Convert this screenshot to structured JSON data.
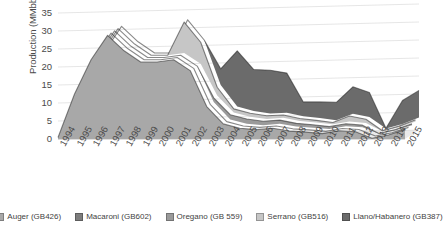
{
  "chart_data": {
    "type": "area",
    "stacked": true,
    "three_d": true,
    "title": "",
    "xlabel": "",
    "ylabel": "Production (MMbbl)",
    "ylim": [
      0,
      35
    ],
    "ytick_step": 5,
    "yticks": [
      35,
      30,
      25,
      20,
      15,
      10,
      5,
      0
    ],
    "grid": true,
    "legend_position": "bottom",
    "x": [
      "1994",
      "1995",
      "1996",
      "1997",
      "1998",
      "1999",
      "2000",
      "2001",
      "2002",
      "2003",
      "2004",
      "2005",
      "2006",
      "2007",
      "2008",
      "2009",
      "2010",
      "2011",
      "2012",
      "2013",
      "2014",
      "2015"
    ],
    "categories": [
      "1994",
      "1995",
      "1996",
      "1997",
      "1998",
      "1999",
      "2000",
      "2001",
      "2002",
      "2003",
      "2004",
      "2005",
      "2006",
      "2007",
      "2008",
      "2009",
      "2010",
      "2011",
      "2012",
      "2013",
      "2014",
      "2015"
    ],
    "series": [
      {
        "name": "Auger (GB426)",
        "color": "#a8a8a8",
        "values": [
          0.4,
          12.5,
          22.0,
          28.8,
          24.5,
          21.4,
          21.4,
          22.0,
          19.0,
          9.0,
          4.2,
          3.0,
          2.6,
          3.0,
          2.2,
          1.9,
          1.5,
          2.3,
          2.0,
          0.2,
          1.1,
          2.6
        ]
      },
      {
        "name": "Macaroni (GB602)",
        "color": "#7d7d7d",
        "values": [
          0.0,
          0.0,
          0.0,
          0.0,
          0.0,
          0.0,
          0.0,
          0.0,
          0.0,
          0.0,
          0.0,
          0.0,
          0.0,
          0.0,
          0.0,
          0.0,
          0.0,
          0.0,
          0.0,
          0.0,
          0.0,
          0.0
        ]
      },
      {
        "name": "Oregano (GB 559)",
        "color": "#9a9a9a",
        "values": [
          0.0,
          0.0,
          0.0,
          0.0,
          0.0,
          0.0,
          0.0,
          0.0,
          0.0,
          1.2,
          1.3,
          1.3,
          1.1,
          1.0,
          0.9,
          0.8,
          0.7,
          0.7,
          0.6,
          0.1,
          0.3,
          0.4
        ]
      },
      {
        "name": "Serrano (GB516)",
        "color": "#c6c6c6",
        "values": [
          0.0,
          0.0,
          0.0,
          0.0,
          0.0,
          0.0,
          0.0,
          8.6,
          6.0,
          2.3,
          1.0,
          1.0,
          0.9,
          0.8,
          0.7,
          0.6,
          0.5,
          1.5,
          1.0,
          0.1,
          0.3,
          0.5
        ]
      },
      {
        "name": "Llano/Habanero (GB387)",
        "color": "#6b6b6b",
        "values": [
          0.0,
          0.0,
          0.0,
          0.0,
          0.0,
          0.0,
          0.0,
          0.0,
          0.0,
          4.5,
          15.5,
          11.5,
          12.0,
          11.0,
          4.0,
          4.5,
          5.0,
          7.5,
          6.8,
          0.1,
          6.5,
          7.5
        ]
      }
    ],
    "totals": [
      0.4,
      12.5,
      22.0,
      28.8,
      24.5,
      21.4,
      21.4,
      30.6,
      25.0,
      17.0,
      22.0,
      16.8,
      16.6,
      15.8,
      7.8,
      7.8,
      7.7,
      12.0,
      10.4,
      0.5,
      8.2,
      11.0
    ]
  },
  "legend": {
    "items": [
      {
        "label": "Auger (GB426)",
        "color": "#a8a8a8"
      },
      {
        "label": "Macaroni (GB602)",
        "color": "#7d7d7d"
      },
      {
        "label": "Oregano (GB 559)",
        "color": "#9a9a9a"
      },
      {
        "label": "Serrano (GB516)",
        "color": "#c6c6c6"
      },
      {
        "label": "Llano/Habanero (GB387)",
        "color": "#6b6b6b"
      }
    ]
  },
  "axes": {
    "y_title": "Production (MMbbl)"
  }
}
